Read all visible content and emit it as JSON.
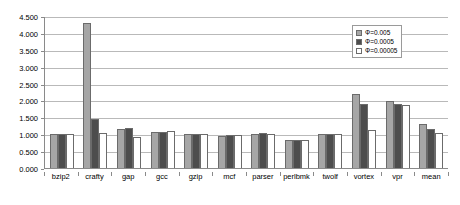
{
  "chart_data": {
    "type": "bar",
    "title": "",
    "subtitle": "",
    "xlabel": "",
    "ylabel": "",
    "ylim": [
      0.0,
      4.5
    ],
    "ytick_step": 0.5,
    "ytick_labels": [
      "0.000",
      "0.500",
      "1.000",
      "1.500",
      "2.000",
      "2.500",
      "3.000",
      "3.500",
      "4.000",
      "4.500"
    ],
    "ytick_values": [
      0.0,
      0.5,
      1.0,
      1.5,
      2.0,
      2.5,
      3.0,
      3.5,
      4.0,
      4.5
    ],
    "grid": "horizontal",
    "legend_position": "top-right",
    "categories": [
      "bzip2",
      "crafty",
      "gap",
      "gcc",
      "gzip",
      "mcf",
      "parser",
      "perlbmk",
      "twolf",
      "vortex",
      "vpr",
      "mean"
    ],
    "series": [
      {
        "name": "Φ=0.005",
        "color": "#a6a6a6",
        "values": [
          1.0,
          4.28,
          1.15,
          1.07,
          1.01,
          0.95,
          1.01,
          0.84,
          1.01,
          2.18,
          1.99,
          1.29
        ]
      },
      {
        "name": "Φ=0.0005",
        "color": "#4d4d4d",
        "values": [
          1.0,
          1.45,
          1.18,
          1.08,
          1.02,
          0.99,
          1.04,
          0.82,
          1.0,
          1.9,
          1.9,
          1.16
        ]
      },
      {
        "name": "Φ=0.00005",
        "color": "#ffffff",
        "values": [
          1.0,
          1.03,
          0.93,
          1.09,
          1.01,
          0.99,
          1.02,
          0.83,
          1.01,
          1.12,
          1.88,
          1.04
        ]
      }
    ]
  }
}
